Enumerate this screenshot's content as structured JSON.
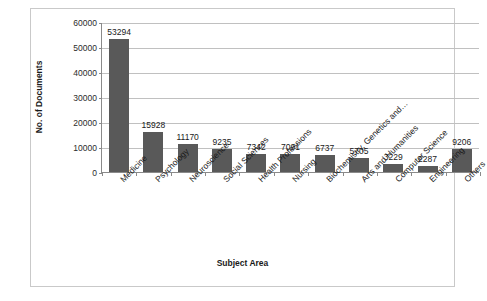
{
  "chart_data": {
    "type": "bar",
    "title": "",
    "xlabel": "Subject Area",
    "ylabel": "No. of Documents",
    "categories": [
      "Medicine",
      "Psychology",
      "Neuroscience",
      "Social Sciences",
      "Health Professions",
      "Nursing",
      "Biochemistry, Genetics and…",
      "Arts and Humanities",
      "Computer Science",
      "Engineering",
      "Others"
    ],
    "values": [
      53294,
      15928,
      11170,
      9235,
      7342,
      7091,
      6737,
      5705,
      3229,
      2287,
      9206
    ],
    "data_labels": [
      "53294",
      "15928",
      "11170",
      "9235",
      "7342",
      "7091",
      "6737",
      "5705",
      "3229",
      "2287",
      "9206"
    ],
    "ylim": [
      0,
      60000
    ],
    "ytick_labels": [
      "60000",
      "50000",
      "40000",
      "30000",
      "20000",
      "10000",
      "0"
    ],
    "ytick_values": [
      60000,
      50000,
      40000,
      30000,
      20000,
      10000,
      0
    ],
    "grid": true,
    "legend": false,
    "bar_color": "#595959",
    "gridline_color": "#c0c0c0",
    "axis_color": "#8a8a8a",
    "border_color": "#c9c9c9"
  }
}
